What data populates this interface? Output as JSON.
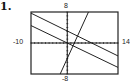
{
  "problem": {
    "number": "1."
  },
  "chart_data": {
    "type": "line",
    "title": "",
    "xlabel": "",
    "ylabel": "",
    "xlim": [
      -10,
      14
    ],
    "ylim": [
      -8,
      8
    ],
    "grid": false,
    "axis_ticks": true,
    "window_labels": {
      "ymax": "8",
      "ymin": "-8",
      "xmin": "-10",
      "xmax": "14"
    },
    "series": [
      {
        "name": "line-1",
        "slope": -0.46,
        "intercept": 3.1,
        "x": [
          -10,
          14
        ],
        "y": [
          7.7,
          -3.4
        ]
      },
      {
        "name": "line-2",
        "slope": -0.45,
        "intercept": 0.0,
        "x": [
          -10,
          14
        ],
        "y": [
          4.9,
          -6.0
        ]
      },
      {
        "name": "line-3",
        "slope": 2.05,
        "intercept": -4.0,
        "x": [
          -2.0,
          5.8
        ],
        "y": [
          -8,
          8
        ]
      }
    ],
    "colors": {
      "line": "#222222",
      "frame": "#222222",
      "axis": "#111111"
    }
  }
}
